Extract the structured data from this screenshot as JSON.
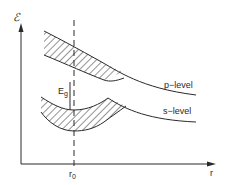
{
  "diagram": {
    "y_axis_label": "ℰ",
    "x_axis_label": "r",
    "r0_label": "r",
    "r0_subscript": "0",
    "gap_label": "E",
    "gap_subscript": "g",
    "upper_band_label": "p−level",
    "lower_band_label": "s−level",
    "colors": {
      "line": "#2a2a2a",
      "background": "#ffffff"
    }
  }
}
